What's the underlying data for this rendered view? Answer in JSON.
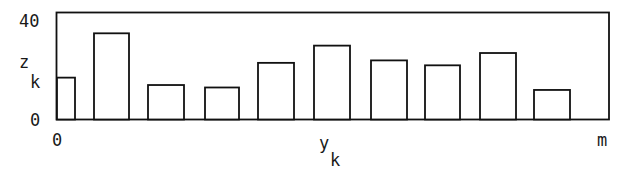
{
  "chart_data": {
    "type": "bar",
    "title": "",
    "xlabel": "y",
    "xlabel_subscript": "k",
    "ylabel": "z",
    "ylabel_subscript": "k",
    "ylim": [
      0,
      40
    ],
    "y_ticks": [
      "0",
      "40"
    ],
    "x_ticks": [
      "0",
      "m"
    ],
    "grid": false,
    "legend": null,
    "categories": [
      "1",
      "2",
      "3",
      "4",
      "5",
      "6",
      "7",
      "8",
      "9",
      "10"
    ],
    "values": [
      17,
      35,
      14,
      13,
      23,
      30,
      24,
      22,
      27,
      12
    ],
    "bar_fill": "#ffffff",
    "bar_stroke": "#111111"
  },
  "labels": {
    "y_top": "40",
    "y_bottom": "0",
    "y_name": "z",
    "y_sub": "k",
    "x_left": "0",
    "x_right": "m",
    "x_name": "y",
    "x_sub": "k"
  }
}
